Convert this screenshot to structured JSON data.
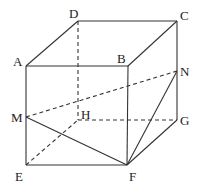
{
  "diagram": {
    "type": "geometry-cube",
    "labels": {
      "A": "A",
      "B": "B",
      "C": "C",
      "D": "D",
      "E": "E",
      "F": "F",
      "G": "G",
      "H": "H",
      "M": "M",
      "N": "N"
    },
    "points": {
      "A": [
        26,
        66
      ],
      "B": [
        128,
        66
      ],
      "C": [
        177,
        21
      ],
      "D": [
        78,
        21
      ],
      "E": [
        26,
        165
      ],
      "F": [
        127,
        165
      ],
      "G": [
        177,
        120
      ],
      "H": [
        78,
        120
      ],
      "M": [
        26,
        117
      ],
      "N": [
        177,
        71
      ]
    },
    "visible_segments": [
      [
        "A",
        "B"
      ],
      [
        "A",
        "D"
      ],
      [
        "D",
        "C"
      ],
      [
        "B",
        "C"
      ],
      [
        "A",
        "E"
      ],
      [
        "E",
        "F"
      ],
      [
        "B",
        "F"
      ],
      [
        "C",
        "G"
      ],
      [
        "F",
        "G"
      ],
      [
        "M",
        "F"
      ],
      [
        "F",
        "N"
      ]
    ],
    "hidden_segments": [
      [
        "D",
        "H"
      ],
      [
        "H",
        "G"
      ],
      [
        "E",
        "H"
      ],
      [
        "M",
        "N"
      ]
    ],
    "colors": {
      "line": "#333333",
      "text": "#222222",
      "background": "#ffffff"
    }
  }
}
